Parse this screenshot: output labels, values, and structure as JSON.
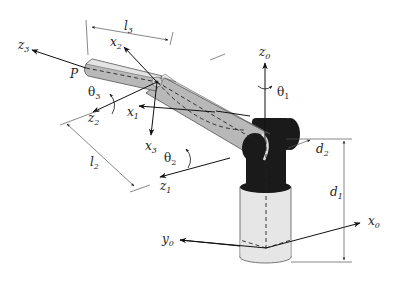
{
  "diagram": {
    "colors": {
      "background": "#ffffff",
      "link_fill": "#b8b8b8",
      "link_top": "#e4e4e4",
      "joint_dark": "#1a1a1a",
      "base_fill": "#e6e6e6",
      "line": "#222222",
      "dim_line": "#555555"
    },
    "labels": {
      "z3": {
        "main": "z",
        "sub": "3"
      },
      "x2": {
        "main": "x",
        "sub": "2"
      },
      "l3": {
        "main": "l",
        "sub": "3"
      },
      "P": {
        "main": "P"
      },
      "theta3": {
        "main": "θ",
        "sub": "3"
      },
      "z2": {
        "main": "z",
        "sub": "2"
      },
      "x1": {
        "main": "x",
        "sub": "1"
      },
      "x3": {
        "main": "x",
        "sub": "3"
      },
      "l2": {
        "main": "l",
        "sub": "2"
      },
      "theta2": {
        "main": "θ",
        "sub": "2"
      },
      "z1": {
        "main": "z",
        "sub": "1"
      },
      "z0": {
        "main": "z",
        "sub": "0"
      },
      "theta1": {
        "main": "θ",
        "sub": "1"
      },
      "d2": {
        "main": "d",
        "sub": "2"
      },
      "d1": {
        "main": "d",
        "sub": "1"
      },
      "x0": {
        "main": "x",
        "sub": "0"
      },
      "y0": {
        "main": "y",
        "sub": "0"
      }
    }
  }
}
